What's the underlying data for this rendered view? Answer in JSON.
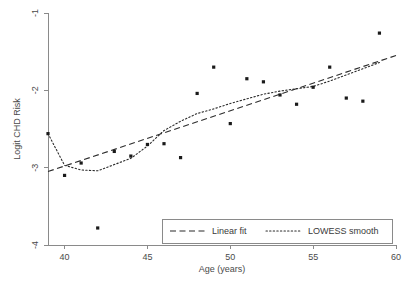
{
  "chart_data": {
    "type": "scatter",
    "title": "",
    "xlabel": "Age (years)",
    "ylabel": "Logit CHD Risk",
    "xlim": [
      39,
      60
    ],
    "ylim": [
      -4,
      -1
    ],
    "xticks": [
      40,
      45,
      50,
      55,
      60
    ],
    "yticks": [
      -1,
      -2,
      -3,
      -4
    ],
    "xtick_labels": [
      "40",
      "45",
      "50",
      "55",
      "60"
    ],
    "ytick_labels": [
      "-1",
      "-2",
      "-3",
      "-4"
    ],
    "grid": false,
    "legend_position": "bottom-right",
    "points": [
      {
        "x": 39,
        "y": -2.56
      },
      {
        "x": 40,
        "y": -3.1
      },
      {
        "x": 41,
        "y": -2.94
      },
      {
        "x": 42,
        "y": -3.78
      },
      {
        "x": 43,
        "y": -2.79
      },
      {
        "x": 44,
        "y": -2.85
      },
      {
        "x": 45,
        "y": -2.7
      },
      {
        "x": 46,
        "y": -2.69
      },
      {
        "x": 47,
        "y": -2.87
      },
      {
        "x": 48,
        "y": -2.04
      },
      {
        "x": 49,
        "y": -1.7
      },
      {
        "x": 50,
        "y": -2.43
      },
      {
        "x": 51,
        "y": -1.85
      },
      {
        "x": 52,
        "y": -1.89
      },
      {
        "x": 53,
        "y": -2.06
      },
      {
        "x": 54,
        "y": -2.18
      },
      {
        "x": 55,
        "y": -1.96
      },
      {
        "x": 56,
        "y": -1.7
      },
      {
        "x": 57,
        "y": -2.1
      },
      {
        "x": 58,
        "y": -2.14
      },
      {
        "x": 59,
        "y": -1.26
      }
    ],
    "series": [
      {
        "name": "Linear fit",
        "style": "dashed",
        "x": [
          39,
          60
        ],
        "values": [
          -3.05,
          -1.55
        ]
      },
      {
        "name": "LOWESS smooth",
        "style": "dotted",
        "x": [
          39,
          40,
          41,
          42,
          43,
          44,
          45,
          46,
          47,
          48,
          49,
          50,
          51,
          52,
          53,
          54,
          55,
          56,
          57,
          58,
          59
        ],
        "values": [
          -2.56,
          -2.97,
          -3.03,
          -3.04,
          -2.96,
          -2.88,
          -2.72,
          -2.52,
          -2.4,
          -2.3,
          -2.24,
          -2.17,
          -2.11,
          -2.05,
          -2.01,
          -1.98,
          -1.95,
          -1.88,
          -1.8,
          -1.72,
          -1.64
        ]
      }
    ],
    "legend": [
      {
        "label": "Linear fit",
        "style": "dashed"
      },
      {
        "label": "LOWESS smooth",
        "style": "dotted"
      }
    ],
    "colors": {
      "point": "#1a1a1a",
      "line": "#2b2b2b",
      "axis": "#8a8a8a",
      "text": "#4a4a4a",
      "background": "#ffffff"
    }
  }
}
